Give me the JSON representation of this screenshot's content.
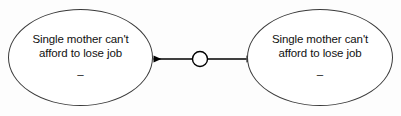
{
  "diagram": {
    "type": "node-link",
    "title": "",
    "background_color": "#fdfdfd",
    "stroke_color": "#3a3a3a",
    "text_color": "#111111",
    "nodes": [
      {
        "id": "left",
        "shape": "ellipse",
        "line1": "Single mother can't",
        "line2": "afford to lose job",
        "mark": "–"
      },
      {
        "id": "right",
        "shape": "ellipse",
        "line1": "Single mother can't",
        "line2": "afford to lose job",
        "mark": "–"
      }
    ],
    "edge": {
      "id": "left-right-link",
      "style": "double-headed-arrow",
      "midpoint_marker": "circle",
      "label": ""
    }
  }
}
